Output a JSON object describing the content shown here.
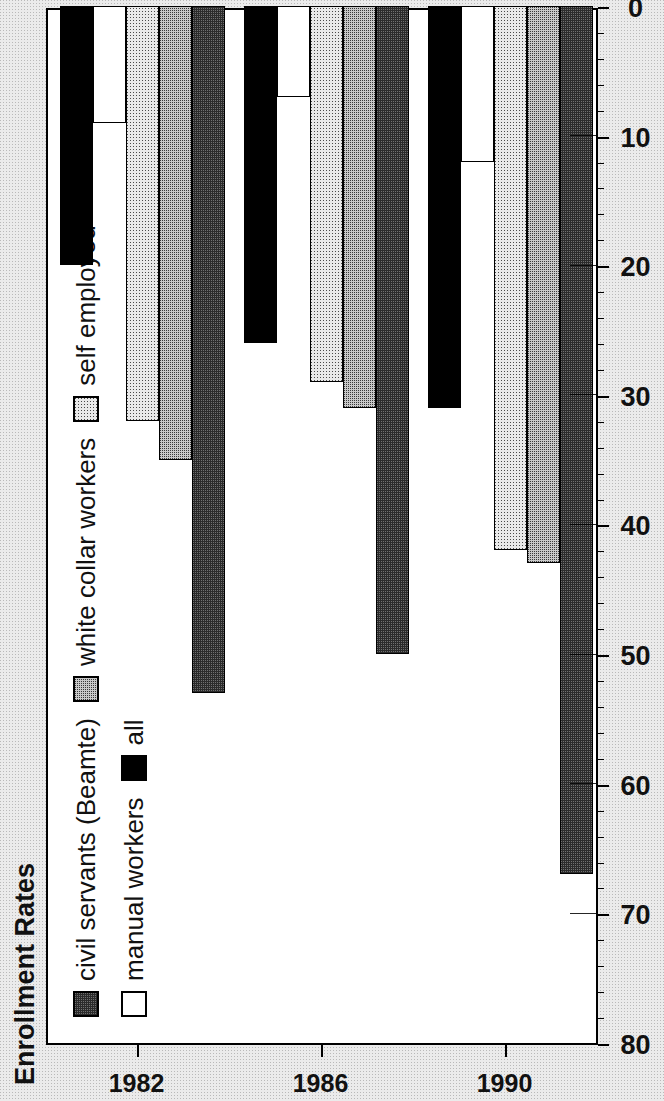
{
  "chart_data": {
    "type": "bar",
    "orientation": "horizontal",
    "title": "Enrollment Rates",
    "xlabel": "",
    "ylabel": "",
    "categories": [
      "1982",
      "1986",
      "1990"
    ],
    "value_axis": {
      "min": 0,
      "max": 80,
      "ticks": [
        80,
        70,
        60,
        50,
        40,
        30,
        20,
        10,
        0
      ],
      "tick_labels": [
        "80",
        "70",
        "60",
        "50",
        "40",
        "30",
        "20",
        "10",
        "0"
      ],
      "direction": "decreasing-left-to-right",
      "minor_ticks_per_interval": 5,
      "grid": false
    },
    "series": [
      {
        "name": "civil servants (Beamte)",
        "pattern": "dark-checker",
        "values": [
          53,
          50,
          67
        ]
      },
      {
        "name": "white collar workers",
        "pattern": "gray-dotted",
        "values": [
          35,
          31,
          43
        ]
      },
      {
        "name": "self employed",
        "pattern": "light-dotted",
        "values": [
          32,
          29,
          42
        ]
      },
      {
        "name": "manual workers",
        "pattern": "white",
        "values": [
          9,
          7,
          12
        ]
      },
      {
        "name": "all",
        "pattern": "solid-black",
        "values": [
          20,
          26,
          31
        ]
      }
    ],
    "legend_position": "top-inside",
    "legend_rows": [
      [
        "civil servants (Beamte)",
        "white collar workers",
        "self employed"
      ],
      [
        "manual workers",
        "all"
      ]
    ]
  },
  "figure": {
    "title": "Enrollment Rates",
    "rotation_note": "90"
  }
}
